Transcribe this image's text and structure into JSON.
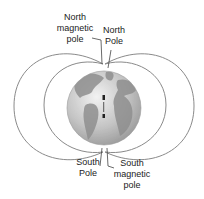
{
  "diagram": {
    "labels": {
      "north_magnetic_pole": "North\nmagnetic\npole",
      "north_pole": "North\nPole",
      "south_pole": "South\nPole",
      "south_magnetic_pole": "South\nmagnetic\npole"
    },
    "colors": {
      "field_line": "#8a8a8a",
      "ocean": "#c9c9c9",
      "land": "#8f8f8f",
      "label_text": "#222222",
      "background": "#ffffff"
    }
  }
}
